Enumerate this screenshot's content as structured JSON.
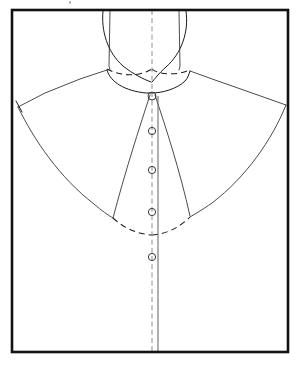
{
  "document": {
    "title": "Shirt Collar and Yoke Pattern Draft",
    "caption": ""
  },
  "canvas": {
    "width": 300,
    "height": 366,
    "background_color": "#ffffff"
  },
  "frame": {
    "name": "pattern-frame-rectangle",
    "left": 12,
    "top": 10,
    "right": 288,
    "bottom": 352,
    "stroke_color": "#121212",
    "stroke_width": 2.6
  },
  "center_front": {
    "label": "center-front-fold-line",
    "style": "dash-dot",
    "color": "#8d8d8d",
    "x": 152,
    "y_start": 10,
    "y_end": 352
  },
  "placket": {
    "label": "placket-edge-line",
    "style": "solid",
    "color": "#6f6f6f",
    "x": 158,
    "y_start": 96,
    "y_end": 352
  },
  "buttons": [
    {
      "label": "button-1-neck",
      "cx": 152,
      "cy": 96,
      "r": 4.0
    },
    {
      "label": "button-2",
      "cx": 152,
      "cy": 131,
      "r": 3.6
    },
    {
      "label": "button-3",
      "cx": 152,
      "cy": 170,
      "r": 3.6
    },
    {
      "label": "button-4",
      "cx": 152,
      "cy": 212,
      "r": 3.6
    },
    {
      "label": "button-5",
      "cx": 152,
      "cy": 257,
      "r": 3.6
    }
  ],
  "lines": {
    "collar_left_outer": "Left collar outer curve",
    "collar_right_outer": "Right collar outer curve",
    "collar_left_inner": "Left collar stand edge",
    "collar_right_inner": "Right collar stand edge",
    "neckline_dashed": "Neckline dashed guide curve",
    "collar_seam_curve": "Collar seam solid curve",
    "shoulder_left": "Left shoulder yoke line",
    "shoulder_right": "Right shoulder yoke line",
    "armhole_left": "Left armhole curve",
    "armhole_right": "Right armhole curve",
    "yoke_dashed": "Lower yoke dashed curve",
    "lapel_left": "Left front lapel edge",
    "lapel_right": "Right front lapel edge"
  },
  "colors": {
    "ink": "#1a1a1a",
    "frame": "#121212",
    "guide_gray": "#8d8d8d",
    "paper": "#ffffff"
  }
}
